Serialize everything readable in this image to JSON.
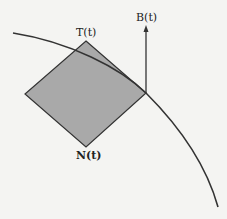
{
  "diagram": {
    "labels": {
      "tangent": "T(t)",
      "normal": "N(t)",
      "binormal": "B(t)"
    },
    "colors": {
      "background": "#f4f4f2",
      "plane_fill": "#a9a9a9",
      "stroke": "#333333"
    }
  }
}
